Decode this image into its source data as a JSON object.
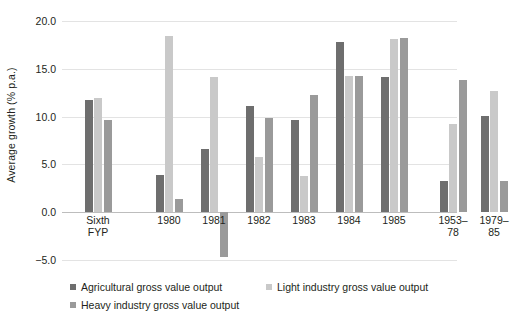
{
  "chart_data": {
    "type": "bar",
    "title": "",
    "subtitle": "",
    "xlabel": "",
    "ylabel": "Average growth (% p.a.)",
    "ylim": [
      -5.0,
      20.0
    ],
    "ytick_labels": [
      "20.0",
      "15.0",
      "10.0",
      "5.0",
      "0.0",
      "−5.0"
    ],
    "ytick_values": [
      20.0,
      15.0,
      10.0,
      5.0,
      0.0,
      -5.0
    ],
    "grid": true,
    "legend_position": "bottom-left",
    "categories": [
      "Sixth FYP",
      "1980",
      "1981",
      "1982",
      "1983",
      "1984",
      "1985",
      "1953–\n78",
      "1979–\n85"
    ],
    "series": [
      {
        "name": "Agricultural gross value output",
        "color": "#6e6e6e",
        "values": [
          11.7,
          3.9,
          6.6,
          11.1,
          9.6,
          17.8,
          14.1,
          3.3,
          10.1
        ]
      },
      {
        "name": "Light industry gross value output",
        "color": "#c9c9c9",
        "values": [
          11.9,
          18.4,
          14.1,
          5.8,
          3.8,
          14.2,
          18.1,
          9.2,
          12.7
        ]
      },
      {
        "name": "Heavy industry gross value output",
        "color": "#9a9a9a",
        "values": [
          9.6,
          1.4,
          -4.7,
          9.9,
          12.3,
          14.2,
          18.2,
          13.8,
          3.3
        ]
      }
    ]
  },
  "legend": {
    "items": [
      "Agricultural gross value output",
      "Light industry gross value output",
      "Heavy industry gross value output"
    ]
  }
}
